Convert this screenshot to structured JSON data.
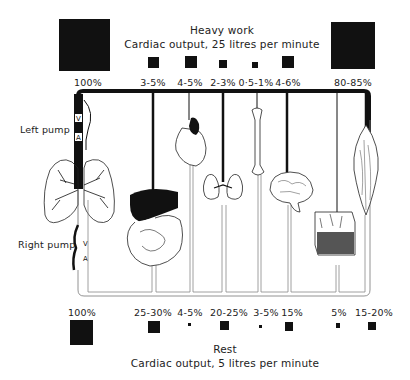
{
  "heavy_work": {
    "title": "Heavy work",
    "subtitle": "Cardiac output, 25 litres per minute",
    "total_label": "100%",
    "organs": [
      {
        "organ": "gut-liver",
        "label": "3-5%",
        "size": 11
      },
      {
        "organ": "heart",
        "label": "4-5%",
        "size": 12
      },
      {
        "organ": "kidney",
        "label": "2-3%",
        "size": 8
      },
      {
        "organ": "bone",
        "label": "0·5-1%",
        "size": 6
      },
      {
        "organ": "brain",
        "label": "4-6%",
        "size": 12
      },
      {
        "organ": "muscle",
        "label": "80-85%",
        "size": 46
      }
    ]
  },
  "rest": {
    "title": "Rest",
    "subtitle": "Cardiac output, 5 litres per minute",
    "total_label": "100%",
    "organs": [
      {
        "organ": "gut-liver",
        "label": "25-30%",
        "size": 12
      },
      {
        "organ": "heart",
        "label": "4-5%",
        "size": 3
      },
      {
        "organ": "kidney",
        "label": "20-25%",
        "size": 9
      },
      {
        "organ": "bone",
        "label": "3-5%",
        "size": 3
      },
      {
        "organ": "brain",
        "label": "15%",
        "size": 8
      },
      {
        "organ": "skin",
        "label": "5%",
        "size": 4
      },
      {
        "organ": "muscle",
        "label": "15-20%",
        "size": 8
      }
    ]
  },
  "pumps": {
    "left": "Left pump",
    "right": "Right pump",
    "ventricle_letter": "V",
    "atrium_letter": "A"
  }
}
